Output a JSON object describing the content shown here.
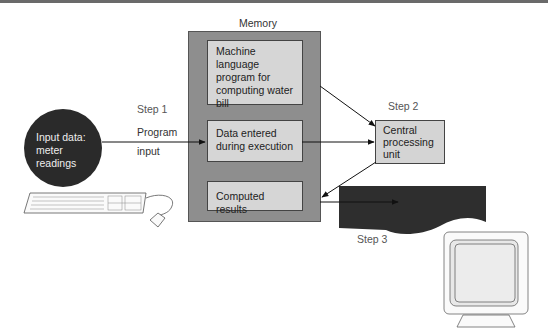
{
  "diagram": {
    "memory": {
      "title": "Memory",
      "boxes": [
        {
          "lines": [
            "Machine language",
            "program for",
            "computing water",
            "bill"
          ]
        },
        {
          "lines": [
            "Data entered",
            "during execution"
          ]
        },
        {
          "lines": [
            "Computed results"
          ]
        }
      ]
    },
    "cpu": {
      "lines": [
        "Central",
        "processing",
        "unit"
      ]
    },
    "input": {
      "lines": [
        "Input data:",
        "meter",
        "readings"
      ]
    },
    "output": {
      "lines": [
        "Output results:",
        "water bill"
      ]
    },
    "steps": {
      "step1": "Step 1",
      "step2": "Step 2",
      "step3": "Step 3"
    },
    "arrows": {
      "program_input": [
        "Program",
        "input"
      ],
      "program_output": [
        "Program",
        "output"
      ]
    },
    "devices": {
      "input_device": "keyboard-and-mouse",
      "output_device": "monitor"
    },
    "colors": {
      "memory_bg": "#8e8e8e",
      "box_bg": "#d6d6d6",
      "circle_bg": "#2a2a2a",
      "doc_bg": "#2e2e2e"
    }
  }
}
